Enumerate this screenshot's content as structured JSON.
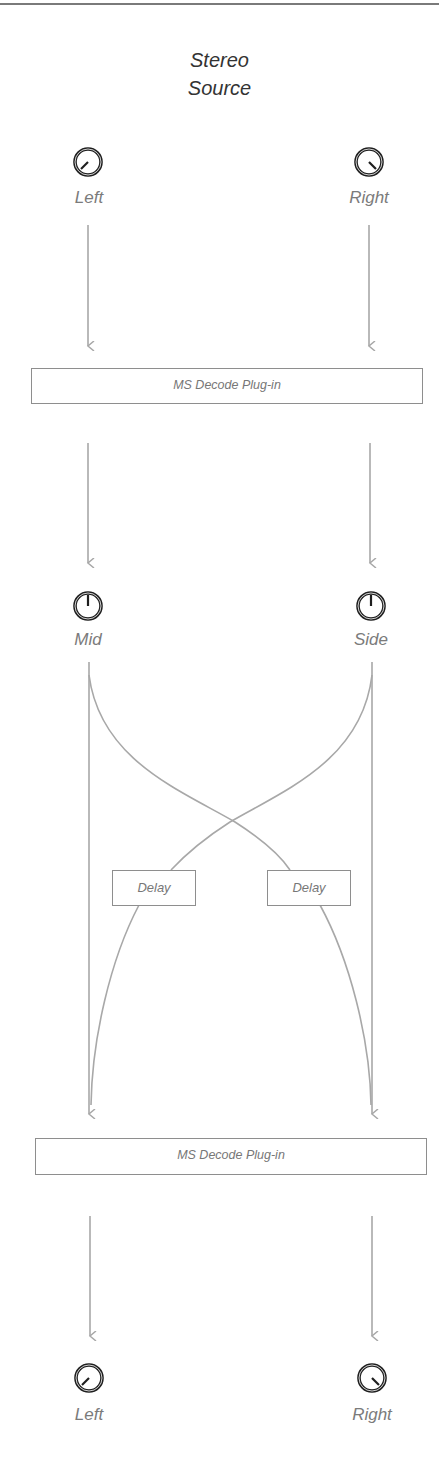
{
  "title": {
    "line1": "Stereo",
    "line2": "Source"
  },
  "input_knobs": [
    {
      "label": "Left",
      "icon": "knob-icon",
      "pointer": "lower-left"
    },
    {
      "label": "Right",
      "icon": "knob-icon",
      "pointer": "lower-right"
    }
  ],
  "plugin_top": {
    "label": "MS Decode Plug-in"
  },
  "ms_knobs": [
    {
      "label": "Mid",
      "icon": "knob-icon",
      "pointer": "up"
    },
    {
      "label": "Side",
      "icon": "knob-icon",
      "pointer": "up"
    }
  ],
  "delays": [
    {
      "label": "Delay"
    },
    {
      "label": "Delay"
    }
  ],
  "plugin_bottom": {
    "label": "MS Decode Plug-in"
  },
  "output_knobs": [
    {
      "label": "Left",
      "icon": "knob-icon",
      "pointer": "lower-left"
    },
    {
      "label": "Right",
      "icon": "knob-icon",
      "pointer": "lower-right"
    }
  ],
  "colors": {
    "line": "#a8a8a8",
    "knob": "#1e1e1e",
    "label": "#7b7b7b",
    "title": "#333333"
  }
}
